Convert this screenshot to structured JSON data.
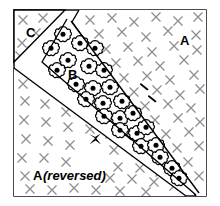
{
  "figure": {
    "kind": "geological-cross-section-diagram",
    "background_color": "#ffffff",
    "line_color": "#000000",
    "frame": {
      "x": 14,
      "y": 10,
      "width": 192,
      "height": 186,
      "stroke": "#000000",
      "stroke_width": 1.4
    },
    "labels": [
      {
        "name": "label-C",
        "text": "C",
        "x": 26,
        "y": 32,
        "size": 13,
        "italic": false
      },
      {
        "name": "label-A-top",
        "text": "A",
        "x": 182,
        "y": 40,
        "size": 13,
        "italic": false
      },
      {
        "name": "label-B",
        "text": "B",
        "x": 70,
        "y": 75,
        "size": 13,
        "italic": false
      },
      {
        "name": "label-A-rev",
        "text": "A",
        "x": 33,
        "y": 176,
        "size": 13,
        "italic": false
      },
      {
        "name": "label-A-rev-note",
        "text": "(reversed)",
        "x": 43,
        "y": 176,
        "size": 13,
        "italic": true
      }
    ],
    "regions": [
      {
        "name": "region-C",
        "label": "C",
        "fill": "cross-hatch"
      },
      {
        "name": "region-A-top",
        "label": "A",
        "fill": "cross-hatch"
      },
      {
        "name": "region-B-band",
        "label": "B",
        "fill": "flower-blobs"
      },
      {
        "name": "region-A-reversed",
        "label": "A (reversed)",
        "fill": "cross-hatch"
      }
    ],
    "textures": {
      "cross_hatch": {
        "glyph": "x-cross",
        "color": "#8a8a8a",
        "count": 92
      },
      "flower_blobs": {
        "glyph": "flower-blob",
        "outline": "#000000",
        "fill": "#ffffff",
        "core": "#000000",
        "count": 24
      }
    },
    "markers": [
      {
        "name": "marker-bowtie",
        "glyph": "bowtie-mark",
        "x": 95,
        "y": 139
      },
      {
        "name": "marker-dash-1",
        "glyph": "dash-mark",
        "x": 145,
        "y": 86
      },
      {
        "name": "marker-dash-2",
        "glyph": "dash-mark",
        "x": 153,
        "y": 98
      },
      {
        "name": "marker-dash-3",
        "glyph": "dash-mark",
        "x": 129,
        "y": 136
      }
    ]
  }
}
